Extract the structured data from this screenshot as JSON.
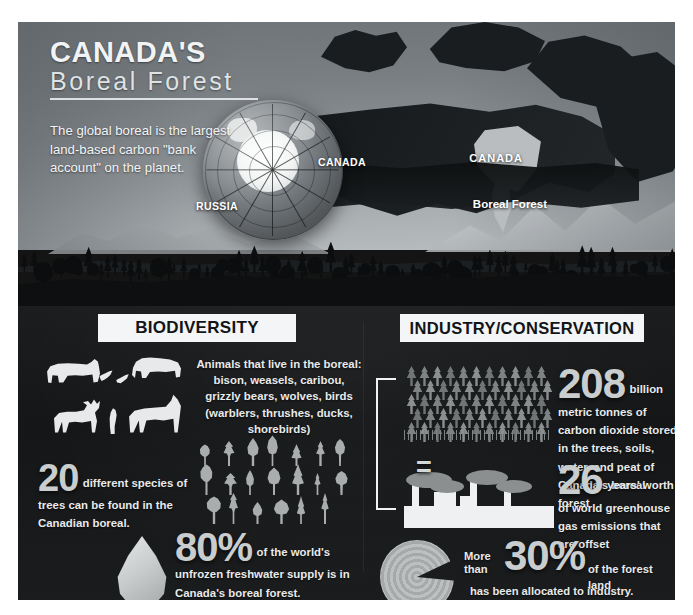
{
  "poster": {
    "title_line1": "CANADA'S",
    "title_line2": "Boreal Forest",
    "lede": "The global boreal is the largest land-based carbon \"bank account\" on the planet."
  },
  "globe": {
    "label_canada": "CANADA",
    "label_russia": "RUSSIA"
  },
  "map": {
    "label_country": "CANADA",
    "label_region": "Boreal Forest"
  },
  "sections": {
    "biodiversity": {
      "heading": "BIODIVERSITY",
      "animals_text": "Animals that live in the boreal: bison, weasels, caribou, grizzly bears, wolves, birds (warblers, thrushes, ducks, shorebirds)",
      "animal_icons": [
        "bear-icon",
        "bird-icon",
        "bird-icon",
        "bison-icon",
        "caribou-icon",
        "weasel-icon",
        "wolf-icon"
      ],
      "trees_number": "20",
      "trees_text": "different species of trees can be found in the Canadian boreal.",
      "tree_icon_count": 20,
      "water_number": "80%",
      "water_text": "of the world's unfrozen freshwater supply is in Canada's boreal forest."
    },
    "industry": {
      "heading": "INDUSTRY/CONSERVATION",
      "equals_symbol": "=",
      "carbon_number": "208",
      "carbon_text": "billion metric tonnes of carbon dioxide stored in the trees, soils, water, and peat of  Canada's boreal forest",
      "years_number": "26",
      "years_text": "years' worth of world greenhouse gas emissions that are offset",
      "allocated_prefix_line1": "More",
      "allocated_prefix_line2": "than",
      "allocated_number": "30%",
      "allocated_text_a": "of the forest land",
      "allocated_text_b": "has been allocated to industry."
    }
  },
  "chart_data": {
    "type": "table",
    "categories": [
      "Tree species in Canadian boreal",
      "World's unfrozen freshwater supply",
      "Carbon dioxide stored (billion metric tonnes)",
      "Years of world greenhouse gas emissions offset",
      "Forest land allocated to industry"
    ],
    "values": [
      20,
      80,
      208,
      26,
      30
    ],
    "units": [
      "species",
      "%",
      "billion metric tonnes",
      "years",
      "%"
    ],
    "xlabel": "",
    "ylabel": ""
  },
  "colors": {
    "poster_background": "#141414",
    "panel_background": "#1a1c1d",
    "sky_top": "#6f7478",
    "sky_bottom": "#b9bdc0",
    "heading_background": "#f3f5f6",
    "heading_text": "#121416",
    "body_text": "#e8eaeb",
    "big_number": "#c9cdce",
    "silhouette_light": "#e7e9ea",
    "silhouette_mid": "#a9adae",
    "forest_tree": "#939798"
  }
}
